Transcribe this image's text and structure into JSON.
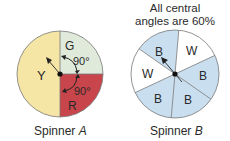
{
  "spinner_a": {
    "caption_prefix": "Spinner ",
    "caption_var": "A",
    "sections": [
      {
        "label": "Y",
        "color": "#f6e6a6"
      },
      {
        "label": "G",
        "color": "#dfeadb"
      },
      {
        "label": "R",
        "color": "#c7454b"
      }
    ],
    "angle_labels": [
      "90°",
      "90°"
    ]
  },
  "spinner_b": {
    "header_line1": "All central",
    "header_line2": "angles are 60%",
    "caption_prefix": "Spinner ",
    "caption_var": "B",
    "sections": [
      {
        "label": "B",
        "color": "#c9dff0"
      },
      {
        "label": "W",
        "color": "#ffffff"
      },
      {
        "label": "B",
        "color": "#c9dff0"
      },
      {
        "label": "B",
        "color": "#c9dff0"
      },
      {
        "label": "B",
        "color": "#c9dff0"
      },
      {
        "label": "W",
        "color": "#ffffff"
      }
    ]
  }
}
